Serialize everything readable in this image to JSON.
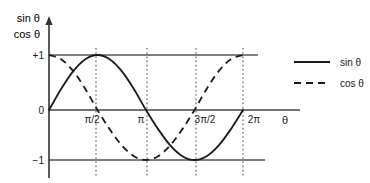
{
  "chart_data": {
    "type": "line",
    "title": "",
    "xlabel": "θ",
    "ylabel_lines": [
      "sin θ",
      "cos θ"
    ],
    "xlim": [
      0,
      6.283185307179586
    ],
    "ylim": [
      -1,
      1
    ],
    "grid": true,
    "grid_style": "vertical dotted at each tick",
    "legend_position": "right",
    "x_ticks": [
      {
        "value": 1.5707963267948966,
        "label": "π/2"
      },
      {
        "value": 3.141592653589793,
        "label": "π"
      },
      {
        "value": 4.71238898038469,
        "label": "3π/2"
      },
      {
        "value": 6.283185307179586,
        "label": "2π"
      }
    ],
    "y_ticks": [
      {
        "value": 1,
        "label": "+1"
      },
      {
        "value": 0,
        "label": "0"
      },
      {
        "value": -1,
        "label": "−1"
      }
    ],
    "series": [
      {
        "name": "sin θ",
        "style": "solid",
        "color": "#1a1a1a",
        "x": [
          0,
          0.3927,
          0.7854,
          1.1781,
          1.5708,
          1.9635,
          2.3562,
          2.7489,
          3.1416,
          3.5343,
          3.927,
          4.3197,
          4.7124,
          5.1051,
          5.4978,
          5.8905,
          6.2832
        ],
        "values": [
          0,
          0.3827,
          0.7071,
          0.9239,
          1,
          0.9239,
          0.7071,
          0.3827,
          0,
          -0.3827,
          -0.7071,
          -0.9239,
          -1,
          -0.9239,
          -0.7071,
          -0.3827,
          0
        ]
      },
      {
        "name": "cos θ",
        "style": "dashed",
        "color": "#1a1a1a",
        "x": [
          0,
          0.3927,
          0.7854,
          1.1781,
          1.5708,
          1.9635,
          2.3562,
          2.7489,
          3.1416,
          3.5343,
          3.927,
          4.3197,
          4.7124,
          5.1051,
          5.4978,
          5.8905,
          6.2832
        ],
        "values": [
          1,
          0.9239,
          0.7071,
          0.3827,
          0,
          -0.3827,
          -0.7071,
          -0.9239,
          -1,
          -0.9239,
          -0.7071,
          -0.3827,
          0,
          0.3827,
          0.7071,
          0.9239,
          1
        ]
      }
    ],
    "reference_lines": [
      {
        "y": 1,
        "label": "+1"
      },
      {
        "y": 0,
        "label": "0"
      },
      {
        "y": -1,
        "label": "−1"
      }
    ]
  },
  "legend": {
    "entries": [
      {
        "label": "sin θ",
        "style": "solid"
      },
      {
        "label": "cos θ",
        "style": "dashed"
      }
    ]
  },
  "axes": {
    "y_axis_title_line1": "sin θ",
    "y_axis_title_line2": "cos θ",
    "x_axis_title": "θ"
  },
  "tick_labels": {
    "y_plus_one": "+1",
    "y_zero": "0",
    "y_minus_one": "−1",
    "x_half_pi": "π/2",
    "x_pi": "π",
    "x_three_half_pi": "3π/2",
    "x_two_pi": "2π"
  },
  "colors": {
    "curve": "#1a1a1a",
    "axis": "#444444",
    "grid": "#555555",
    "background": "#ffffff"
  }
}
